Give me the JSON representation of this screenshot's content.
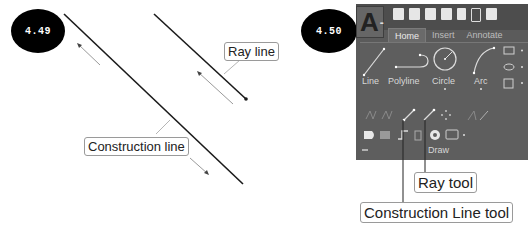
{
  "figures": [
    {
      "id": "4.49",
      "badge": "4.49",
      "callouts": {
        "ray_line": "Ray line",
        "construction_line": "Construction line"
      }
    },
    {
      "id": "4.50",
      "badge": "4.50",
      "ribbon": {
        "app_button": "A",
        "tabs": [
          {
            "label": "Home",
            "active": true
          },
          {
            "label": "Insert",
            "active": false
          },
          {
            "label": "Annotate",
            "active": false
          }
        ],
        "tools": [
          {
            "label": "Line",
            "icon": "line-icon"
          },
          {
            "label": "Polyline",
            "icon": "polyline-icon"
          },
          {
            "label": "Circle",
            "icon": "circle-icon"
          },
          {
            "label": "Arc",
            "icon": "arc-icon"
          }
        ],
        "panel_title": "Draw"
      },
      "callouts": {
        "ray_tool": "Ray tool",
        "construction_line_tool": "Construction Line tool"
      }
    }
  ],
  "colors": {
    "badge_bg": "#000000",
    "ribbon_bg": "#5b5b5b",
    "line": "#1a1a1a",
    "arrow": "#8a8a8a"
  }
}
